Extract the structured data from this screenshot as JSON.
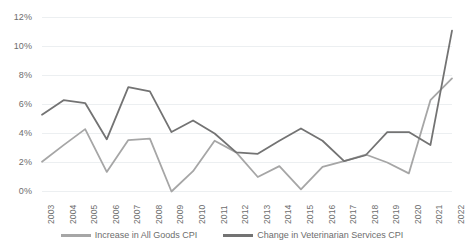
{
  "chart_data": {
    "type": "line",
    "title": "",
    "subtitle": "",
    "xlabel": "",
    "ylabel": "",
    "grid": true,
    "legend_position": "bottom",
    "ylim": [
      0,
      12
    ],
    "ytick_labels": [
      "12%",
      "10%",
      "8%",
      "6%",
      "4%",
      "2%",
      "0%"
    ],
    "ytick_values": [
      12,
      10,
      8,
      6,
      4,
      2,
      0
    ],
    "categories": [
      "2003",
      "2004",
      "2005",
      "2006",
      "2007",
      "2008",
      "2009",
      "2010",
      "2011",
      "2012",
      "2013",
      "2014",
      "2015",
      "2016",
      "2017",
      "2018",
      "2019",
      "2020",
      "2021",
      "2022"
    ],
    "series": [
      {
        "name": "Increase in All Goods CPI",
        "color": "#a6a6a6",
        "values": [
          2.05,
          3.2,
          4.3,
          1.35,
          3.55,
          3.65,
          0.0,
          1.4,
          3.5,
          2.7,
          1.0,
          1.75,
          0.15,
          1.7,
          2.1,
          2.55,
          2.0,
          1.25,
          6.3,
          7.8
        ]
      },
      {
        "name": "Change in Veterinarian Services CPI",
        "color": "#737373",
        "values": [
          5.3,
          6.3,
          6.1,
          3.6,
          7.2,
          6.9,
          4.1,
          4.9,
          4.0,
          2.7,
          2.6,
          3.5,
          4.35,
          3.5,
          2.1,
          2.5,
          4.1,
          4.1,
          3.2,
          11.1
        ]
      }
    ]
  },
  "legend": {
    "items": [
      {
        "label": "Increase in All Goods CPI",
        "color": "#a6a6a6"
      },
      {
        "label": "Change in Veterinarian Services CPI",
        "color": "#737373"
      }
    ]
  },
  "colors": {
    "background": "#ffffff",
    "gridline": "#eceff1",
    "tick_text": "#6d6d6d",
    "series_all_goods": "#a6a6a6",
    "series_vet_services": "#737373"
  }
}
